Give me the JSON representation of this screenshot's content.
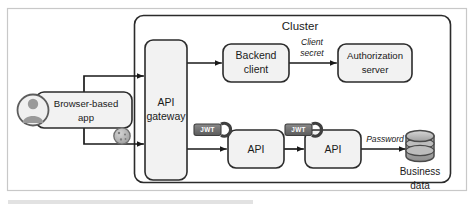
{
  "figure": {
    "title": "Cluster",
    "background": "#ffffff",
    "frame_color": "#c8c8c8",
    "stroke_color": "#2b2b2b",
    "node_fill": "#f2f2f2",
    "token_fill": "#6b6b6b",
    "db_fill": "#b8b8b8"
  },
  "cluster": {
    "label": "Cluster"
  },
  "nodes": {
    "browser_app": {
      "label_line1": "Browser-based",
      "label_line2": "app",
      "x": 36,
      "y": 92,
      "w": 96,
      "h": 36
    },
    "api_gateway": {
      "label_line1": "API",
      "label_line2": "gateway",
      "x": 145,
      "y": 40,
      "w": 42,
      "h": 140
    },
    "backend_client": {
      "label_line1": "Backend",
      "label_line2": "client",
      "x": 223,
      "y": 44,
      "w": 66,
      "h": 38
    },
    "authorization_server": {
      "label_line1": "Authorization",
      "label_line2": "server",
      "x": 338,
      "y": 44,
      "w": 74,
      "h": 38
    },
    "api_one": {
      "label_line1": "API",
      "x": 228,
      "y": 130,
      "w": 56,
      "h": 38
    },
    "api_two": {
      "label_line1": "API",
      "x": 305,
      "y": 130,
      "w": 56,
      "h": 38
    },
    "business_data": {
      "label_line1": "Business",
      "label_line2": "data",
      "x": 418,
      "y": 128
    }
  },
  "edge_labels": {
    "client_secret_line1": "Client",
    "client_secret_line2": "secret",
    "password": "Password"
  },
  "tokens": {
    "jwt_first": "JWT",
    "jwt_second": "JWT"
  },
  "icons": {
    "user_avatar": "user-avatar-icon",
    "session_cookie": "cookie-icon",
    "database": "database-cylinder-icon",
    "jwt_key": "jwt-key-icon",
    "arrow": "arrow-head-icon"
  }
}
